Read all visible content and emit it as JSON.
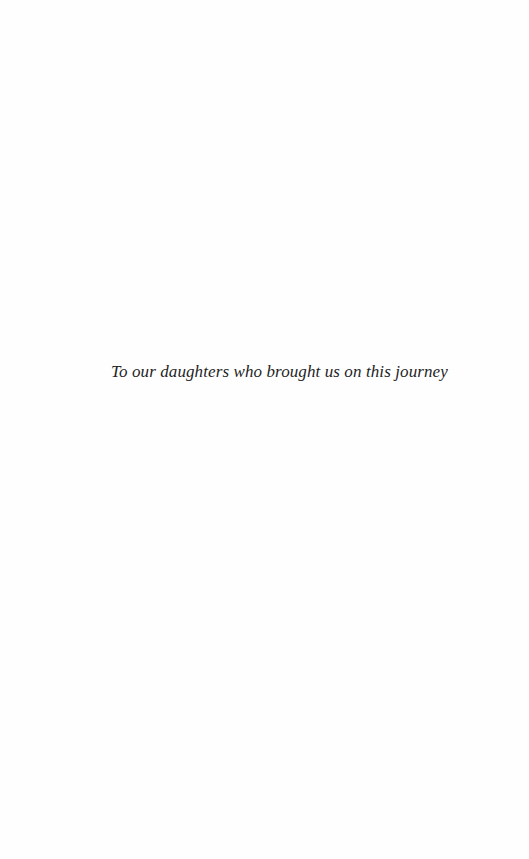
{
  "page": {
    "dedication": "To our daughters who brought us on this journey"
  }
}
